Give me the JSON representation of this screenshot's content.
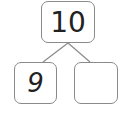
{
  "diagram": {
    "type": "number-bond",
    "whole": {
      "value": "10"
    },
    "parts": [
      {
        "value": "9"
      },
      {
        "value": ""
      }
    ],
    "colors": {
      "border": "#8a8a8a",
      "text": "#222222",
      "lines": "#8a8a8a"
    }
  }
}
